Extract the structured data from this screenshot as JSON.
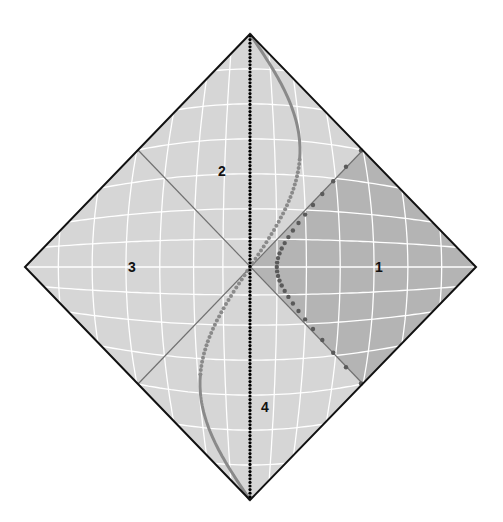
{
  "diagram": {
    "type": "penrose-diagram",
    "regions": [
      {
        "id": "1",
        "label": "1",
        "shade": "dark"
      },
      {
        "id": "2",
        "label": "2",
        "shade": "light"
      },
      {
        "id": "3",
        "label": "3",
        "shade": "light"
      },
      {
        "id": "4",
        "label": "4",
        "shade": "light"
      }
    ],
    "colors": {
      "background": "#ffffff",
      "region_light": "#d6d6d6",
      "region_dark": "#b4b4b4",
      "grid_line": "#ffffff",
      "outline": "#111111",
      "horizon_line": "#707070",
      "vertical_dotted": "#000000",
      "s_curve": "#8a8a8a",
      "hyperbola_dots": "#5a5a5a"
    },
    "curves": [
      {
        "id": "vertical-axis",
        "style": "dotted-black",
        "description": "vertical worldline through centre"
      },
      {
        "id": "s-curve",
        "style": "gray solid/dotted",
        "description": "S-shaped worldline top to bottom"
      },
      {
        "id": "hyperbola",
        "style": "dark-dotted",
        "description": "hyperbolic worldline in region 1"
      }
    ]
  }
}
